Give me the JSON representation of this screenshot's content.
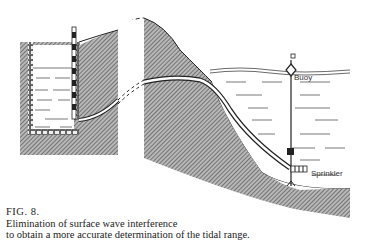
{
  "figure": {
    "number_label": "FIG. 8.",
    "caption_line1": "Elimination of surface wave interference",
    "caption_line2": "to obtain a more accurate determination of the tidal range."
  },
  "labels": {
    "buoy": "Buoy",
    "sprinkler": "Sprinkler"
  },
  "colors": {
    "hatch": "#555555",
    "line": "#222222",
    "background": "#ffffff"
  }
}
